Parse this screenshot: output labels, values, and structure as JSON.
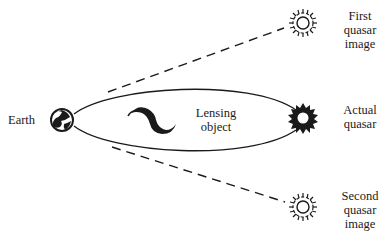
{
  "diagram": {
    "nodes": {
      "earth": {
        "label": "Earth",
        "icon": "earth-globe-icon"
      },
      "lens": {
        "label_line1": "Lensing",
        "label_line2": "object",
        "icon": "galaxy-swirl-icon"
      },
      "first_image": {
        "label_line1": "First",
        "label_line2": "quasar",
        "label_line3": "image",
        "icon": "quasar-image-outline-icon"
      },
      "actual": {
        "label_line1": "Actual",
        "label_line2": "quasar",
        "icon": "quasar-solid-icon"
      },
      "second_image": {
        "label_line1": "Second",
        "label_line2": "quasar",
        "label_line3": "image",
        "icon": "quasar-image-outline-icon"
      }
    },
    "edges": [
      {
        "from": "earth",
        "to": "actual",
        "style": "solid-curve",
        "description": "light path bent above lens"
      },
      {
        "from": "earth",
        "to": "actual",
        "style": "solid-curve",
        "description": "light path bent below lens"
      },
      {
        "from": "earth",
        "to": "first_image",
        "style": "dashed",
        "description": "apparent direction of first image"
      },
      {
        "from": "earth",
        "to": "second_image",
        "style": "dashed",
        "description": "apparent direction of second image"
      }
    ],
    "colors": {
      "ink": "#1a1a1a",
      "background": "#ffffff"
    }
  }
}
